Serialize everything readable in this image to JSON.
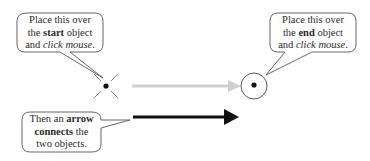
{
  "callouts": {
    "start": {
      "line1": "Place this over",
      "line2_pre": "the ",
      "line2_bold": "start",
      "line2_post": " object",
      "line3_pre": "and ",
      "line3_italic": "click mouse",
      "line3_post": "."
    },
    "end": {
      "line1": "Place this over",
      "line2_pre": "the ",
      "line2_bold": "end",
      "line2_post": " object",
      "line3_pre": "and ",
      "line3_italic": "click mouse",
      "line3_post": "."
    },
    "result": {
      "line1_pre": "Then an ",
      "line1_bold": "arrow",
      "line2_bold": "connects",
      "line2_post": " the",
      "line3": "two objects."
    }
  },
  "icons": {
    "start_cursor": "crosshair-x-cursor-icon",
    "end_cursor": "circle-dot-cursor-icon"
  },
  "colors": {
    "preview_arrow": "#cccccc",
    "final_arrow": "#111111",
    "bubble_border": "#555555"
  }
}
